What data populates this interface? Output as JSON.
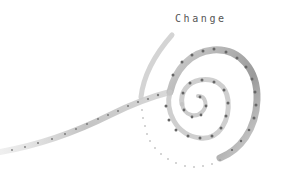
{
  "illustration": {
    "title": "Change",
    "subject": "hand-drawn spiral with dotted stitching",
    "colors": {
      "background": "#ffffff",
      "stroke": "#b9b9b9",
      "stroke_dark": "#8a8a8a",
      "dots": "#6b6b6b",
      "title": "#555555"
    }
  }
}
